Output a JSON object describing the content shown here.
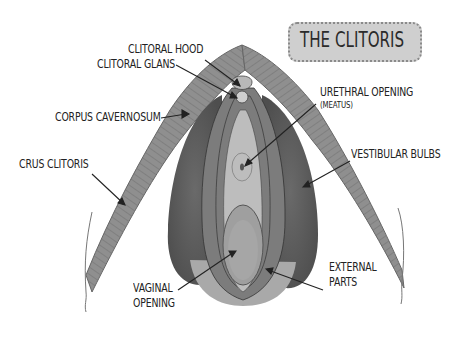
{
  "title": "THE CLITORIS",
  "labels": {
    "clitoral_hood": "CLITORAL HOOD",
    "clitoral_glans": "CLITORAL GLANS",
    "corpus_cavernosum": "CORPUS CAVERNOSUM",
    "crus_clitoris": "CRUS CLITORIS",
    "urethral_opening": "URETHRAL OPENING",
    "meatus": "(MEATUS)",
    "vestibular_bulbs": "VESTIBULAR BULBS",
    "vaginal_opening_1": "VAGINAL",
    "vaginal_opening_2": "OPENING",
    "external_parts_1": "EXTERNAL",
    "external_parts_2": "PARTS"
  },
  "colors": {
    "background": "#ffffff",
    "crura": "#8e8e8e",
    "bulbs": "#5e5e5e",
    "labia": "#7a7a7a",
    "vestibule": "#b8b8b8",
    "title_box": "#cfcfcf",
    "text": "#222222"
  }
}
